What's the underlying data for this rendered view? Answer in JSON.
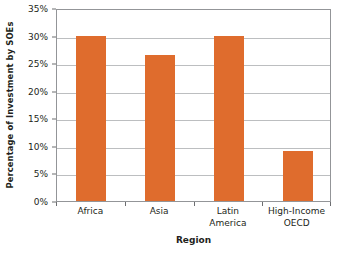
{
  "chart_data": {
    "type": "bar",
    "title": "",
    "xlabel": "Region",
    "ylabel": "Percentage of Investment by SOEs",
    "categories": [
      "Africa",
      "Asia",
      "Latin America",
      "High-Income OECD"
    ],
    "category_lines": [
      [
        "Africa"
      ],
      [
        "Asia"
      ],
      [
        "Latin",
        "America"
      ],
      [
        "High-Income",
        "OECD"
      ]
    ],
    "values": [
      30.0,
      26.5,
      30.0,
      9.0
    ],
    "ylim": [
      0,
      35
    ],
    "ytick_values": [
      0,
      5,
      10,
      15,
      20,
      25,
      30,
      35
    ],
    "ytick_labels": [
      "0%",
      "5%",
      "10%",
      "15%",
      "20%",
      "25%",
      "30%",
      "35%"
    ],
    "grid": "horizontal",
    "legend": "none",
    "bar_color": "#df6c2d",
    "gridline_color": "#bcbec0",
    "frame_color": "#939598",
    "background_color": "#ffffff"
  }
}
